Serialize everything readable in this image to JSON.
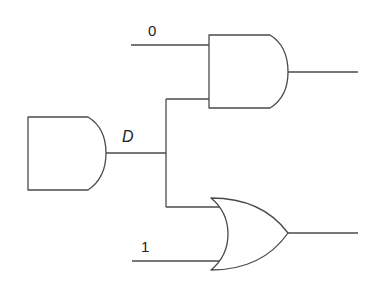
{
  "diagram": {
    "type": "logic-circuit",
    "colors": {
      "line": "#4a4a4a",
      "text": "#222222",
      "background": "#ffffff"
    },
    "gates": [
      {
        "id": "g1",
        "kind": "AND",
        "name": "source-and-gate",
        "output_label": "D"
      },
      {
        "id": "g2",
        "kind": "AND",
        "name": "upper-and-gate",
        "inputs": [
          "0",
          "D"
        ]
      },
      {
        "id": "g3",
        "kind": "OR",
        "name": "lower-or-gate",
        "inputs": [
          "D",
          "1"
        ]
      }
    ],
    "labels": {
      "input_top": "0",
      "input_bottom": "1",
      "signal_d": "D"
    }
  }
}
